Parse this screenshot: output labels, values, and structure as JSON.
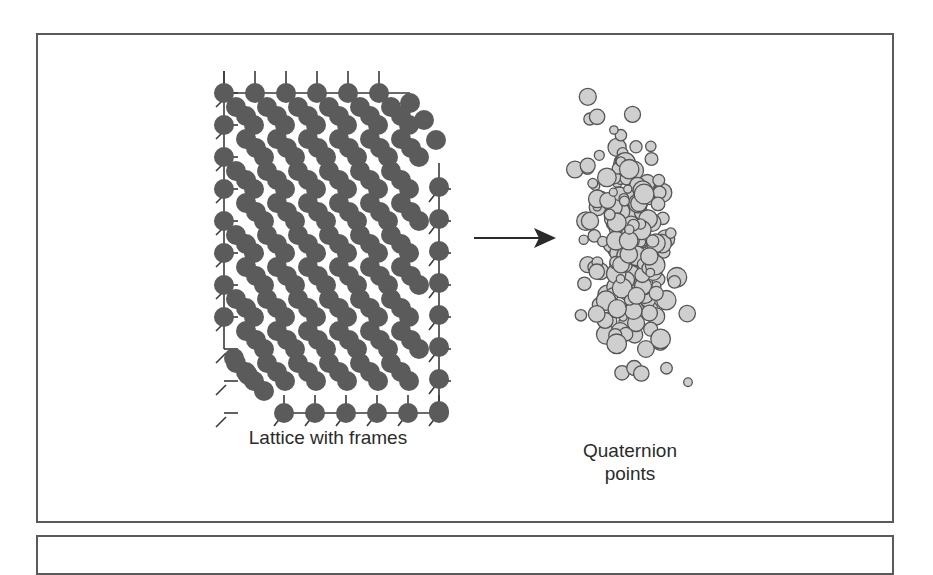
{
  "diagram": {
    "labels": {
      "lattice": "Lattice with frames",
      "quaternion": "Quaternion points"
    },
    "colors": {
      "border": "#5a5a5a",
      "lattice_node": "#5b5b5b",
      "frame_line": "#3a3a3a",
      "point_fill": "#cfcfcf",
      "point_stroke": "#555555",
      "arrow": "#2a2a2a"
    },
    "arrow": {
      "x1": 474,
      "y1": 238,
      "x2": 556,
      "y2": 238,
      "direction": "right"
    },
    "lattice": {
      "origin_x": 224,
      "origin_y": 93,
      "cols": 8,
      "rows": 11,
      "dx": 31,
      "dy": 32,
      "node_r": 10
    },
    "point_cloud": {
      "center_x": 628,
      "center_y": 250,
      "count": 210,
      "spread_x": 30,
      "spread_y": 95
    }
  }
}
